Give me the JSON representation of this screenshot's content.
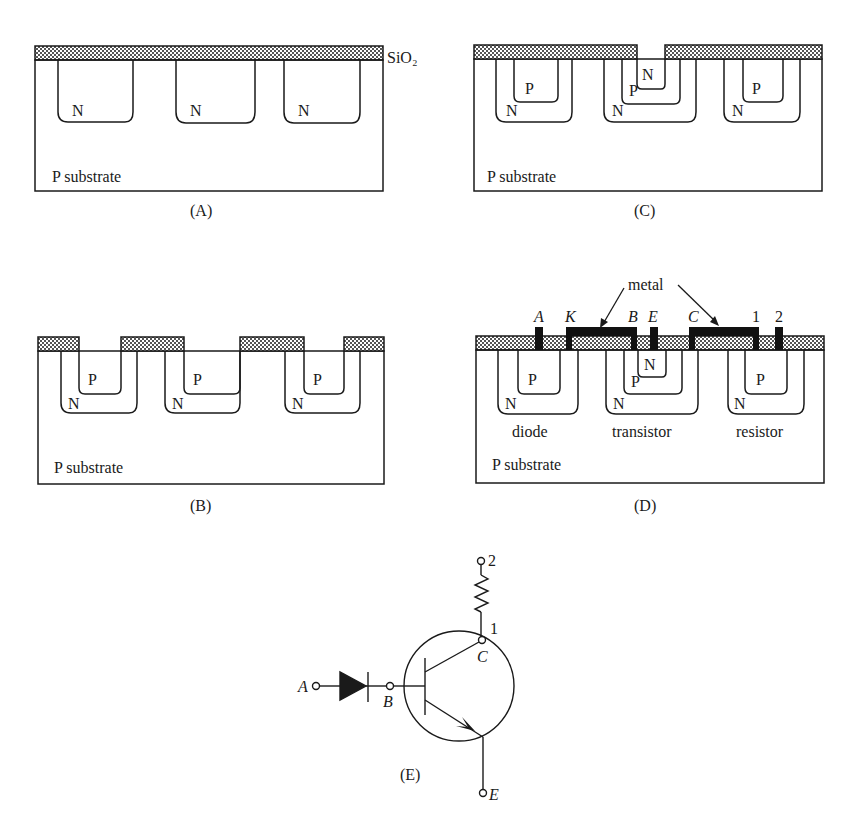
{
  "colors": {
    "ink": "#1a1a1a",
    "oxide_fill": "#d9d9d9",
    "metal": "#111111",
    "background": "#ffffff"
  },
  "panels": {
    "A": {
      "caption": "(A)",
      "oxide_label": "SiO₂",
      "regions": [
        "N",
        "N",
        "N"
      ],
      "substrate_label": "P substrate"
    },
    "B": {
      "caption": "(B)",
      "outer_regions": [
        "N",
        "N",
        "N"
      ],
      "inner_regions": [
        "P",
        "P",
        "P"
      ],
      "substrate_label": "P substrate"
    },
    "C": {
      "caption": "(C)",
      "outer_regions": [
        "N",
        "N",
        "N"
      ],
      "inner_regions": [
        "P",
        "P",
        "P"
      ],
      "emitter_region": "N",
      "substrate_label": "P substrate"
    },
    "D": {
      "caption": "(D)",
      "metal_label": "metal",
      "contacts": [
        "A",
        "K",
        "B",
        "E",
        "C",
        "1",
        "2"
      ],
      "outer_regions": [
        "N",
        "N",
        "N"
      ],
      "inner_regions": [
        "P",
        "P",
        "P"
      ],
      "emitter_region": "N",
      "device_labels": [
        "diode",
        "transistor",
        "resistor"
      ],
      "substrate_label": "P substrate"
    },
    "E": {
      "caption": "(E)",
      "terminals": {
        "anode": "A",
        "base": "B",
        "collector": "C",
        "emitter": "E",
        "res_top": "2",
        "res_bottom": "1"
      }
    }
  }
}
